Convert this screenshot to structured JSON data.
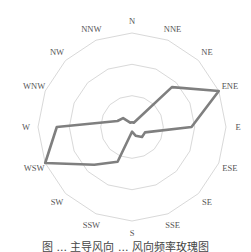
{
  "chart_data": {
    "type": "radar",
    "title": "",
    "categories": [
      "N",
      "NNE",
      "NE",
      "ENE",
      "E",
      "ESE",
      "SE",
      "SSE",
      "S",
      "SSW",
      "SW",
      "WSW",
      "W",
      "WNW",
      "NW",
      "NNW"
    ],
    "series": [
      {
        "name": "wind frequency",
        "values": [
          1.5,
          1.5,
          18,
          30,
          19,
          4.5,
          4.5,
          3,
          1.5,
          12,
          17,
          30,
          24,
          5,
          4,
          1.5
        ],
        "color": "#7f7f7f"
      }
    ],
    "rings": [
      10,
      20,
      30
    ],
    "rmax": 30,
    "grid": true,
    "grid_color": "#d9d9d9",
    "legend": "none"
  },
  "caption": "图 ... 主导风向 ... 风向频率玫瑰图"
}
